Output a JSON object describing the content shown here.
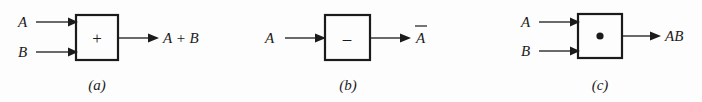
{
  "figure": {
    "name": "logic-gate-symbols",
    "background_color": "#fdfdfd",
    "ink_color": "#1b1b1b"
  },
  "diagrams": [
    {
      "id": "a",
      "caption": "(a)",
      "operator": "+",
      "operator_name": "plus-sign",
      "inputs": [
        {
          "label": "A"
        },
        {
          "label": "B"
        }
      ],
      "output": {
        "label": "A + B"
      }
    },
    {
      "id": "b",
      "caption": "(b)",
      "operator": "–",
      "operator_name": "minus-sign",
      "inputs": [
        {
          "label": "A"
        }
      ],
      "output": {
        "label": "A",
        "overbar": true
      }
    },
    {
      "id": "c",
      "caption": "(c)",
      "operator": "•",
      "operator_name": "dot-sign",
      "inputs": [
        {
          "label": "A"
        },
        {
          "label": "B"
        }
      ],
      "output": {
        "label": "AB"
      }
    }
  ]
}
